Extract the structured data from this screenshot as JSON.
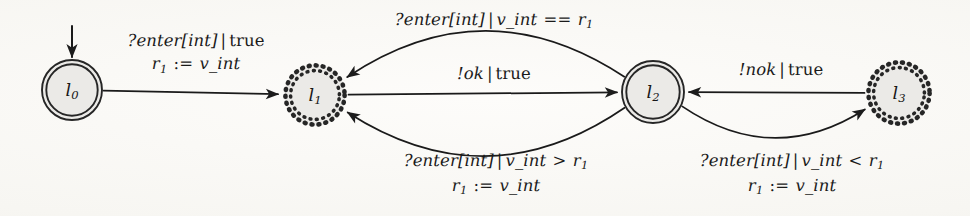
{
  "figure": {
    "kind": "state-machine-diagram",
    "background_color": "#fbfaf8",
    "ink_color": "#1a1a1a",
    "node_fill_color": "#ebeae7",
    "node_stroke_color": "#262626"
  },
  "nodes": [
    {
      "id": "l0",
      "label_base": "l",
      "label_sub": "0",
      "shape": "double-circle",
      "border": "solid",
      "cx": 72,
      "cy": 90,
      "r": 30,
      "initial": true
    },
    {
      "id": "l1",
      "label_base": "l",
      "label_sub": "1",
      "shape": "circle",
      "border": "dotted",
      "cx": 315,
      "cy": 95,
      "r": 32,
      "initial": false
    },
    {
      "id": "l2",
      "label_base": "l",
      "label_sub": "2",
      "shape": "double-circle",
      "border": "solid",
      "cx": 653,
      "cy": 92,
      "r": 31,
      "initial": false
    },
    {
      "id": "l3",
      "label_base": "l",
      "label_sub": "3",
      "shape": "circle",
      "border": "dotted",
      "cx": 899,
      "cy": 93,
      "r": 33,
      "initial": false
    }
  ],
  "initial_marker": {
    "from_node": "l0",
    "direction": "down",
    "x": 72,
    "y_start": 26,
    "y_end": 57
  },
  "transitions": [
    {
      "id": "t0",
      "from": "l0",
      "to": "l1",
      "path": "straight",
      "label_lines": [
        {
          "parts": [
            {
              "t": "?enter[int]",
              "s": "ital"
            },
            {
              "t": "|",
              "s": "sep"
            },
            {
              "t": "true",
              "s": "rom"
            }
          ]
        },
        {
          "parts": [
            {
              "t": "r",
              "s": "ital"
            },
            {
              "t": "1",
              "s": "sub"
            },
            {
              "t": " := ",
              "s": "op"
            },
            {
              "t": "v_int",
              "s": "ital"
            }
          ]
        }
      ],
      "label_x": 196,
      "label_y": 29
    },
    {
      "id": "t1",
      "from": "l2",
      "to": "l1",
      "path": "curve-above",
      "label_lines": [
        {
          "parts": [
            {
              "t": "?enter[int]",
              "s": "ital"
            },
            {
              "t": "|",
              "s": "sep"
            },
            {
              "t": "v_int",
              "s": "ital"
            },
            {
              "t": " == ",
              "s": "op"
            },
            {
              "t": "r",
              "s": "ital"
            },
            {
              "t": "1",
              "s": "sub"
            }
          ]
        }
      ],
      "label_x": 494,
      "label_y": 8
    },
    {
      "id": "t2",
      "from": "l1",
      "to": "l2",
      "path": "straight",
      "label_lines": [
        {
          "parts": [
            {
              "t": "!ok",
              "s": "ital"
            },
            {
              "t": "|",
              "s": "sep"
            },
            {
              "t": "true",
              "s": "rom"
            }
          ]
        }
      ],
      "label_x": 494,
      "label_y": 62
    },
    {
      "id": "t3",
      "from": "l2",
      "to": "l1",
      "path": "curve-below",
      "label_lines": [
        {
          "parts": [
            {
              "t": "?enter[int]",
              "s": "ital"
            },
            {
              "t": "|",
              "s": "sep"
            },
            {
              "t": "v_int",
              "s": "ital"
            },
            {
              "t": " > ",
              "s": "op"
            },
            {
              "t": "r",
              "s": "ital"
            },
            {
              "t": "1",
              "s": "sub"
            }
          ]
        },
        {
          "parts": [
            {
              "t": "r",
              "s": "ital"
            },
            {
              "t": "1",
              "s": "sub"
            },
            {
              "t": " := ",
              "s": "op"
            },
            {
              "t": "v_int",
              "s": "ital"
            }
          ]
        }
      ],
      "label_x": 496,
      "label_y": 149
    },
    {
      "id": "t4",
      "from": "l3",
      "to": "l2",
      "path": "straight",
      "label_lines": [
        {
          "parts": [
            {
              "t": "!nok",
              "s": "ital"
            },
            {
              "t": "|",
              "s": "sep"
            },
            {
              "t": "true",
              "s": "rom"
            }
          ]
        }
      ],
      "label_x": 781,
      "label_y": 58
    },
    {
      "id": "t5",
      "from": "l2",
      "to": "l3",
      "path": "curve-below",
      "label_lines": [
        {
          "parts": [
            {
              "t": "?enter[int]",
              "s": "ital"
            },
            {
              "t": "|",
              "s": "sep"
            },
            {
              "t": "v_int",
              "s": "ital"
            },
            {
              "t": " < ",
              "s": "op"
            },
            {
              "t": "r",
              "s": "ital"
            },
            {
              "t": "1",
              "s": "sub"
            }
          ]
        },
        {
          "parts": [
            {
              "t": "r",
              "s": "ital"
            },
            {
              "t": "1",
              "s": "sub"
            },
            {
              "t": " := ",
              "s": "op"
            },
            {
              "t": "v_int",
              "s": "ital"
            }
          ]
        }
      ],
      "label_x": 792,
      "label_y": 149
    }
  ]
}
